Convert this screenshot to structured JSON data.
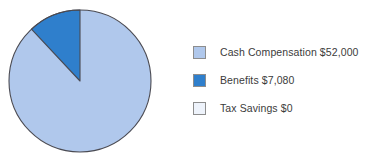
{
  "chart_data": {
    "type": "pie",
    "title": "",
    "legend_position": "right",
    "categories": [
      "Cash Compensation",
      "Benefits",
      "Tax Savings"
    ],
    "values": [
      52000,
      7080,
      0
    ],
    "value_labels": [
      "$52,000",
      "$7,080",
      "$0"
    ],
    "colors": [
      "#b0c8ec",
      "#2f7fcc",
      "#eef3fb"
    ],
    "slice_outline_color": "#4a4a52",
    "start_angle_deg": 0,
    "direction": "counterclockwise",
    "total": 59080,
    "percentages": [
      88.02,
      11.98,
      0
    ],
    "slices": [
      {
        "label": "Cash Compensation",
        "value": 52000,
        "value_label": "$52,000",
        "percent": 88.02,
        "color": "#b0c8ec"
      },
      {
        "label": "Benefits",
        "value": 7080,
        "value_label": "$7,080",
        "percent": 11.98,
        "color": "#2f7fcc"
      },
      {
        "label": "Tax Savings",
        "value": 0,
        "value_label": "$0",
        "percent": 0,
        "color": "#eef3fb"
      }
    ]
  },
  "legend": {
    "items": [
      {
        "text": "Cash Compensation $52,000",
        "color": "#b0c8ec"
      },
      {
        "text": "Benefits $7,080",
        "color": "#2f7fcc"
      },
      {
        "text": "Tax Savings $0",
        "color": "#eef3fb"
      }
    ]
  },
  "style": {
    "background": "#ffffff",
    "text_color": "#3b3b3b",
    "swatch_border": "#8d8d8d"
  }
}
